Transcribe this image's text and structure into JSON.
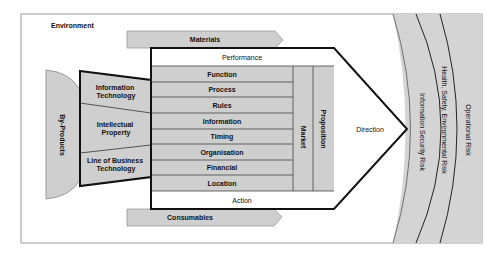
{
  "diagram": {
    "environment_label": "Environment",
    "inputs": {
      "materials": "Materials",
      "consumables": "Consumables"
    },
    "by_products": "By-Products",
    "capabilities": [
      {
        "label_line1": "Information",
        "label_line2": "Technology"
      },
      {
        "label_line1": "Intellectual",
        "label_line2": "Property"
      },
      {
        "label_line1": "Line of Business",
        "label_line2": "Technology"
      }
    ],
    "core": {
      "top": "Performance",
      "rows": [
        "Function",
        "Process",
        "Rules",
        "Information",
        "Timing",
        "Organisation",
        "Financial",
        "Location"
      ],
      "bottom": "Action",
      "columns": [
        "Market",
        "Proposition"
      ]
    },
    "direction": "Direction",
    "risk_bands": [
      "Information Security Risk",
      "Health, Safety, Environmental Risk",
      "Operational Risk"
    ],
    "colors": {
      "fill_grey": "#cfcfcf",
      "band_grey": "#d4d4d4",
      "outline": "#111111",
      "frame": "#9a9a9a",
      "background": "#ffffff"
    }
  }
}
